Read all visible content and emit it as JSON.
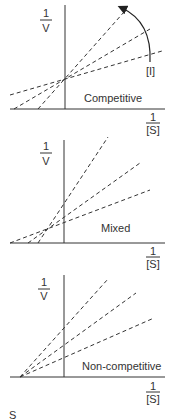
{
  "panels": [
    {
      "title": "Competitive",
      "y_axis_label": {
        "numerator": "1",
        "denominator": "V"
      },
      "x_axis_label": {
        "numerator": "1",
        "denominator": "[S]"
      },
      "arrow_label": "[I]"
    },
    {
      "title": "Mixed",
      "y_axis_label": {
        "numerator": "1",
        "denominator": "V"
      },
      "x_axis_label": {
        "numerator": "1",
        "denominator": "[S]"
      }
    },
    {
      "title": "Non-competitive",
      "y_axis_label": {
        "numerator": "1",
        "denominator": "V"
      },
      "x_axis_label": {
        "numerator": "1",
        "denominator": "[S]"
      }
    }
  ],
  "footer_fragment": "S",
  "colors": {
    "line": "#333333",
    "background": "#ffffff"
  }
}
